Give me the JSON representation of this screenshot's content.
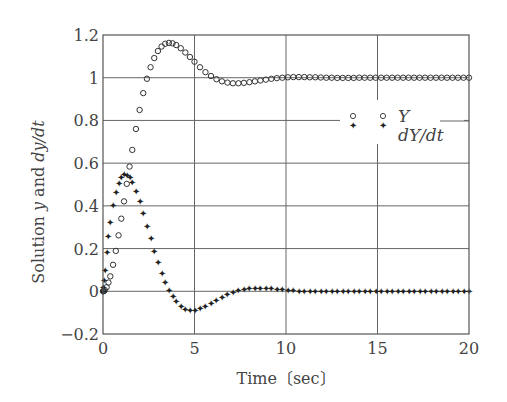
{
  "chart_data": {
    "type": "scatter",
    "title": "",
    "xlabel": "Time〔sec〕",
    "ylabel_parts": [
      "Solution ",
      "y",
      " and ",
      "dy/dt"
    ],
    "xlim": [
      0,
      20
    ],
    "ylim": [
      -0.2,
      1.2
    ],
    "xticks": [
      0,
      5,
      10,
      15,
      20
    ],
    "xtick_labels": [
      "0",
      "5",
      "10",
      "15",
      "20"
    ],
    "yticks": [
      -0.2,
      0,
      0.2,
      0.4,
      0.6,
      0.8,
      1.0,
      1.2
    ],
    "ytick_labels": [
      "−0.2",
      "0",
      "0.2",
      "0.4",
      "0.6",
      "0.8",
      "1",
      "1.2"
    ],
    "grid": true,
    "legend_position": "center-right",
    "x": [
      0,
      0.02,
      0.05,
      0.1,
      0.2,
      0.3,
      0.4,
      0.55,
      0.7,
      0.85,
      1.0,
      1.15,
      1.3,
      1.45,
      1.6,
      1.8,
      2.0,
      2.2,
      2.4,
      2.6,
      2.8,
      3.0,
      3.2,
      3.4,
      3.6,
      3.8,
      4.0,
      4.25,
      4.5,
      4.75,
      5.0,
      5.3,
      5.6,
      5.9,
      6.2,
      6.5,
      6.8,
      7.1,
      7.4,
      7.7,
      8.0,
      8.3,
      8.6,
      8.9,
      9.2,
      9.5,
      9.8,
      10.1,
      10.4,
      10.7,
      11.0,
      11.3,
      11.6,
      11.9,
      12.2,
      12.5,
      12.8,
      13.1,
      13.4,
      13.7,
      14.0,
      14.3,
      14.6,
      14.9,
      15.2,
      15.5,
      15.8,
      16.1,
      16.4,
      16.7,
      17.0,
      17.3,
      17.6,
      17.9,
      18.2,
      18.5,
      18.8,
      19.1,
      19.4,
      19.7,
      20.0
    ],
    "series": [
      {
        "name": "Y",
        "marker": "circle-open",
        "values": [
          0,
          0.0002,
          0.001,
          0.005,
          0.019,
          0.041,
          0.07,
          0.124,
          0.189,
          0.262,
          0.34,
          0.421,
          0.503,
          0.584,
          0.662,
          0.76,
          0.849,
          0.928,
          0.995,
          1.049,
          1.092,
          1.125,
          1.146,
          1.159,
          1.163,
          1.161,
          1.153,
          1.138,
          1.118,
          1.097,
          1.075,
          1.049,
          1.026,
          1.008,
          0.993,
          0.983,
          0.977,
          0.974,
          0.974,
          0.976,
          0.979,
          0.983,
          0.987,
          0.991,
          0.995,
          0.998,
          1.0,
          1.002,
          1.003,
          1.003,
          1.003,
          1.002,
          1.002,
          1.001,
          1.0,
          1.0,
          0.999,
          0.999,
          0.999,
          0.999,
          1.0,
          1.0,
          1.0,
          1.0,
          1.0,
          1.0,
          1.0,
          1.0,
          1.0,
          1.0,
          1.0,
          1.0,
          1.0,
          1.0,
          1.0,
          1.0,
          1.0,
          1.0,
          1.0,
          1.0,
          1.0
        ]
      },
      {
        "name": "dY/dt",
        "marker": "star-filled",
        "values": [
          0,
          0.02,
          0.049,
          0.095,
          0.18,
          0.255,
          0.321,
          0.402,
          0.464,
          0.507,
          0.533,
          0.545,
          0.544,
          0.532,
          0.51,
          0.469,
          0.419,
          0.363,
          0.304,
          0.245,
          0.187,
          0.133,
          0.084,
          0.041,
          0.005,
          -0.026,
          -0.049,
          -0.071,
          -0.084,
          -0.089,
          -0.088,
          -0.081,
          -0.07,
          -0.056,
          -0.041,
          -0.028,
          -0.015,
          -0.004,
          0.004,
          0.009,
          0.013,
          0.014,
          0.014,
          0.013,
          0.012,
          0.009,
          0.007,
          0.004,
          0.002,
          0.0,
          -0.001,
          -0.002,
          -0.002,
          -0.002,
          -0.002,
          -0.001,
          -0.001,
          0.0,
          0.0,
          0.0,
          0.0,
          0.0,
          0.0,
          0.0,
          0.0,
          0.0,
          0.0,
          0.0,
          0.0,
          0.0,
          0.0,
          0.0,
          0.0,
          0.0,
          0.0,
          0.0,
          0.0,
          0.0,
          0.0,
          0.0,
          0.0
        ]
      }
    ],
    "legend": [
      {
        "label": "Y",
        "marker": "circle-open"
      },
      {
        "label": "dY/dt",
        "marker": "star-filled"
      }
    ]
  },
  "colors": {
    "axis": "#555555",
    "grid": "#666666",
    "marker": "#333333",
    "background": "#ffffff"
  }
}
